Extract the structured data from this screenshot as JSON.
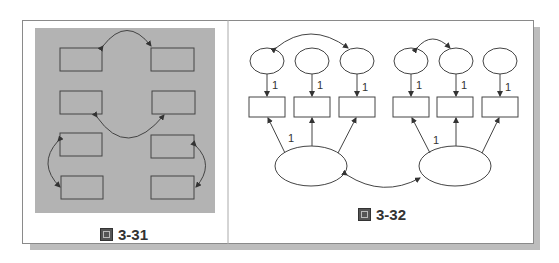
{
  "figures": [
    {
      "id": "fig-3-31",
      "caption": "3-31",
      "panel_color": "#b3b3b3",
      "boxes": 8,
      "description": "Eight rectangles in two columns on gray background with four curved double-headed arrows"
    },
    {
      "id": "fig-3-32",
      "caption": "3-32",
      "small_ellipses": 6,
      "boxes": 6,
      "large_ellipses": 2,
      "error_path_labels": [
        "1",
        "1",
        "1",
        "1",
        "1",
        "1"
      ],
      "loading_labels": [
        "1",
        "1"
      ]
    }
  ],
  "colors": {
    "line": "#444444",
    "frame": "#8a8a8a",
    "shadow": "#bdbdbd"
  }
}
